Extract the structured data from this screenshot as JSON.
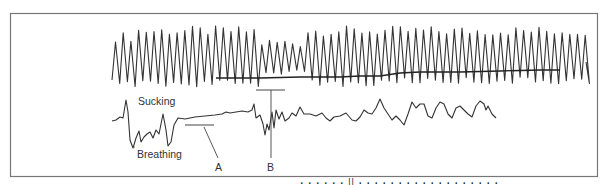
{
  "figure": {
    "type": "physiological-trace-diagram",
    "traces": [
      {
        "name": "Sucking",
        "label": "Sucking",
        "description": "high-frequency oscillatory trace on top"
      },
      {
        "name": "Breathing",
        "label": "Breathing",
        "description": "lower-frequency irregular trace below"
      }
    ],
    "markers": [
      {
        "id": "A",
        "label": "A"
      },
      {
        "id": "B",
        "label": "B"
      }
    ],
    "colors": {
      "trace": "#333333",
      "frame": "#777777",
      "background": "#ffffff"
    },
    "caption_fragment": "(caption text cut off at bottom edge)"
  }
}
